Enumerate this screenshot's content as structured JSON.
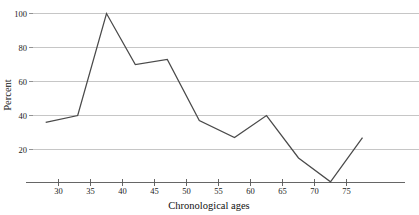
{
  "chart_data": {
    "type": "line",
    "title": "",
    "xlabel": "Chronological ages",
    "ylabel": "Percent",
    "xlim": [
      27,
      79
    ],
    "ylim": [
      0,
      103
    ],
    "grid": "horizontal",
    "legend": "none",
    "x_ticks": [
      30,
      35,
      40,
      45,
      50,
      55,
      60,
      65,
      70,
      75
    ],
    "y_ticks": [
      20,
      40,
      60,
      80,
      100
    ],
    "series": [
      {
        "name": "Percent",
        "color": "#4a4a4a",
        "x": [
          28,
          33,
          37.5,
          42,
          47,
          52,
          57.5,
          62.5,
          67.5,
          72.5,
          77.5
        ],
        "values": [
          36,
          40,
          100,
          70,
          73,
          37,
          27,
          40,
          15,
          1,
          27
        ]
      }
    ]
  },
  "axes": {
    "y_title": "Percent",
    "x_title": "Chronological ages",
    "y_tick_labels": [
      "100",
      "80",
      "60",
      "40",
      "20"
    ],
    "x_tick_labels": [
      "30",
      "35",
      "40",
      "45",
      "50",
      "55",
      "60",
      "65",
      "70",
      "75"
    ]
  },
  "colors": {
    "line": "#4a4a4a",
    "grid": "#b8b8b8",
    "axis": "#555555",
    "text": "#1a1a1a",
    "background": "#ffffff"
  }
}
